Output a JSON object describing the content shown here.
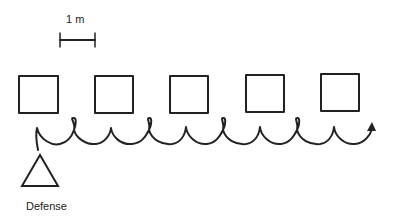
{
  "diagram": {
    "scale_label": "1 m",
    "defense_label": "Defense",
    "colors": {
      "stroke": "#222222",
      "background": "#ffffff"
    },
    "cones": [
      {
        "x": 19,
        "y": 76,
        "size": 39
      },
      {
        "x": 95,
        "y": 76,
        "size": 38
      },
      {
        "x": 170,
        "y": 76,
        "size": 38
      },
      {
        "x": 246,
        "y": 75,
        "size": 38
      },
      {
        "x": 321,
        "y": 74,
        "size": 38
      }
    ]
  }
}
